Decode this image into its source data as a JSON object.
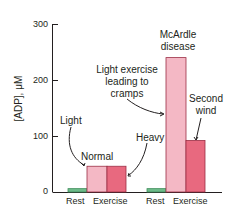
{
  "chart_data": {
    "type": "bar",
    "title": "",
    "xlabel": "",
    "ylabel": "[ADP], μM",
    "ylim": [
      0,
      300
    ],
    "yticks": [
      0,
      100,
      200,
      300
    ],
    "grid": false,
    "groups": [
      {
        "name": "Normal",
        "categories": [
          "Rest",
          "Exercise"
        ],
        "bars": [
          {
            "category": "Rest",
            "label": "Rest",
            "value": 6,
            "color": "#6dbb8a"
          },
          {
            "category": "Exercise",
            "label": "Light",
            "value": 46,
            "color": "#f4b8c5"
          },
          {
            "category": "Exercise",
            "label": "Heavy",
            "value": 46,
            "color": "#e8697f"
          }
        ]
      },
      {
        "name": "McArdle disease",
        "categories": [
          "Rest",
          "Exercise"
        ],
        "bars": [
          {
            "category": "Rest",
            "label": "Rest",
            "value": 6,
            "color": "#6dbb8a"
          },
          {
            "category": "Exercise",
            "label": "Light exercise leading to cramps",
            "value": 240,
            "color": "#f4b8c5"
          },
          {
            "category": "Exercise",
            "label": "Second wind",
            "value": 92,
            "color": "#e8697f"
          }
        ]
      }
    ],
    "annotations": [
      "Light",
      "Normal",
      "Heavy",
      "McArdle disease",
      "Light exercise leading to cramps",
      "Second wind"
    ],
    "x_tick_labels": [
      "Rest",
      "Exercise",
      "Rest",
      "Exercise"
    ]
  },
  "labels": {
    "ylabel": "[ADP], μM",
    "tick_0": "0",
    "tick_100": "100",
    "tick_200": "200",
    "tick_300": "300",
    "light": "Light",
    "normal": "Normal",
    "heavy": "Heavy",
    "mcardle_1": "McArdle",
    "mcardle_2": "disease",
    "cramps_1": "Light exercise",
    "cramps_2": "leading to",
    "cramps_3": "cramps",
    "second_1": "Second",
    "second_2": "wind",
    "x_rest_1": "Rest",
    "x_ex_1": "Exercise",
    "x_rest_2": "Rest",
    "x_ex_2": "Exercise"
  }
}
